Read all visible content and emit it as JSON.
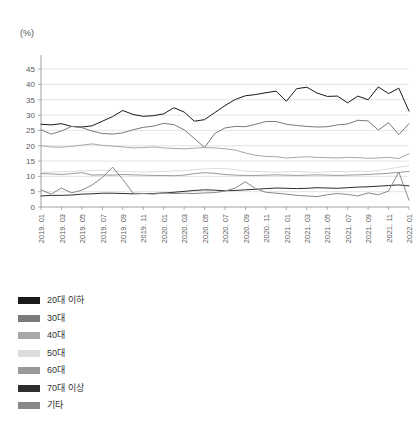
{
  "axis_unit_label": "(%)",
  "legend": {
    "items": [
      {
        "label": "20대 이하",
        "color": "#1a1a1a"
      },
      {
        "label": "30대",
        "color": "#7a7a7a"
      },
      {
        "label": "40대",
        "color": "#a8a8a8"
      },
      {
        "label": "50대",
        "color": "#dcdcdc"
      },
      {
        "label": "60대",
        "color": "#999999"
      },
      {
        "label": "70대 이상",
        "color": "#2e2e2e"
      },
      {
        "label": "기타",
        "color": "#888888"
      }
    ]
  },
  "chart_data": {
    "type": "line",
    "title": "",
    "xlabel": "",
    "ylabel": "(%)",
    "ylim": [
      0,
      47
    ],
    "yticks": [
      0,
      5,
      10,
      15,
      20,
      25,
      30,
      35,
      40,
      45
    ],
    "grid": true,
    "legend_position": "bottom-left",
    "x": [
      "2019.01",
      "2019.02",
      "2019.03",
      "2019.04",
      "2019.05",
      "2019.06",
      "2019.07",
      "2019.08",
      "2019.09",
      "2019.10",
      "2019.11",
      "2019.12",
      "2020.01",
      "2020.02",
      "2020.03",
      "2020.04",
      "2020.05",
      "2020.06",
      "2020.07",
      "2020.08",
      "2020.09",
      "2020.10",
      "2020.11",
      "2020.12",
      "2021.01",
      "2021.02",
      "2021.03",
      "2021.04",
      "2021.05",
      "2021.06",
      "2021.07",
      "2021.08",
      "2021.09",
      "2021.10",
      "2021.11",
      "2021.12",
      "2022.01"
    ],
    "xtick_labels": [
      "2019. 01",
      "2019. 03",
      "2019. 05",
      "2019. 07",
      "2019. 09",
      "2019. 11",
      "2020. 01",
      "2020. 03",
      "2020. 05",
      "2020. 07",
      "2020. 09",
      "2020. 11",
      "2021. 01",
      "2021. 03",
      "2021. 05",
      "2021. 07",
      "2021. 09",
      "2021. 11",
      "2022. 01"
    ],
    "xtick_every": 2,
    "series": [
      {
        "name": "20대 이하",
        "color": "#1a1a1a",
        "values": [
          27.0,
          26.8,
          27.2,
          26.3,
          26.1,
          26.5,
          28.0,
          29.5,
          31.5,
          30.2,
          29.6,
          29.8,
          30.4,
          32.4,
          31.0,
          28.0,
          28.5,
          30.8,
          33.1,
          35.1,
          36.3,
          36.7,
          37.3,
          37.8,
          34.5,
          38.6,
          39.1,
          37.2,
          36.1,
          36.2,
          34.0,
          36.2,
          35.0,
          39.2,
          37.0,
          38.8,
          31.3
        ]
      },
      {
        "name": "30대",
        "color": "#7a7a7a",
        "values": [
          25.2,
          23.8,
          24.8,
          26.3,
          25.9,
          24.8,
          24.0,
          23.8,
          24.2,
          25.2,
          26.0,
          26.4,
          27.3,
          26.9,
          25.2,
          22.4,
          19.4,
          24.0,
          25.8,
          26.3,
          26.2,
          27.0,
          27.9,
          27.9,
          27.0,
          26.6,
          26.3,
          26.1,
          26.2,
          26.8,
          27.1,
          28.3,
          28.1,
          25.1,
          27.5,
          23.6,
          27.2
        ]
      },
      {
        "name": "40대",
        "color": "#a8a8a8",
        "values": [
          20.0,
          19.6,
          19.5,
          19.8,
          20.2,
          20.6,
          20.1,
          19.9,
          19.6,
          19.3,
          19.4,
          19.6,
          19.3,
          19.1,
          19.0,
          19.2,
          19.4,
          19.3,
          19.0,
          18.6,
          17.6,
          16.9,
          16.5,
          16.4,
          16.0,
          16.2,
          16.4,
          16.2,
          16.1,
          16.0,
          16.2,
          16.1,
          15.9,
          16.0,
          16.2,
          15.8,
          17.4
        ]
      },
      {
        "name": "50대",
        "color": "#dcdcdc",
        "values": [
          11.3,
          11.4,
          11.5,
          11.6,
          11.8,
          11.9,
          12.0,
          11.8,
          11.6,
          11.5,
          11.4,
          11.5,
          11.6,
          11.8,
          11.9,
          12.2,
          12.4,
          12.6,
          12.5,
          12.2,
          11.7,
          11.6,
          11.5,
          11.4,
          11.5,
          11.6,
          11.4,
          11.3,
          11.5,
          11.6,
          11.5,
          11.7,
          11.6,
          11.9,
          12.4,
          13.0,
          13.4
        ]
      },
      {
        "name": "60대",
        "color": "#999999",
        "values": [
          10.9,
          10.8,
          10.6,
          10.9,
          11.2,
          10.4,
          10.5,
          10.4,
          10.6,
          10.5,
          10.4,
          10.3,
          10.3,
          10.2,
          10.4,
          10.9,
          11.2,
          11.0,
          10.6,
          10.4,
          10.3,
          10.3,
          10.4,
          10.5,
          10.4,
          10.3,
          10.4,
          10.5,
          10.4,
          10.3,
          10.4,
          10.5,
          10.6,
          10.8,
          11.0,
          11.3,
          11.6
        ]
      },
      {
        "name": "70대 이상",
        "color": "#2e2e2e",
        "values": [
          3.6,
          3.8,
          3.8,
          3.9,
          4.2,
          4.3,
          4.5,
          4.5,
          4.4,
          4.3,
          4.4,
          4.4,
          4.6,
          4.8,
          5.1,
          5.4,
          5.6,
          5.5,
          5.3,
          5.4,
          5.6,
          5.8,
          6.0,
          6.2,
          6.1,
          6.0,
          6.1,
          6.3,
          6.2,
          6.1,
          6.3,
          6.5,
          6.6,
          6.8,
          7.0,
          7.2,
          6.9
        ]
      },
      {
        "name": "기타",
        "color": "#888888",
        "values": [
          5.6,
          4.2,
          6.2,
          4.6,
          5.5,
          7.2,
          9.6,
          13.0,
          9.0,
          4.5,
          4.4,
          4.2,
          4.6,
          4.4,
          4.5,
          4.4,
          4.6,
          4.7,
          5.2,
          6.2,
          8.2,
          6.0,
          4.8,
          4.5,
          4.2,
          3.8,
          3.6,
          3.4,
          4.0,
          4.4,
          4.1,
          3.6,
          4.6,
          4.0,
          5.2,
          11.4,
          2.2
        ]
      }
    ]
  }
}
